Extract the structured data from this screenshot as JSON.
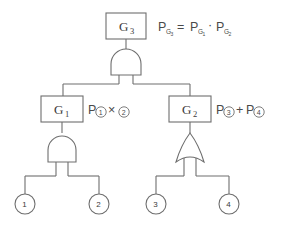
{
  "diagram": {
    "type": "fault-tree",
    "title": "",
    "top_gate": {
      "box_label_main": "G",
      "box_label_sub": "3",
      "gate_type": "AND",
      "gate_icon": "and-gate-icon"
    },
    "top_formula": {
      "p1": "P",
      "p1_sub": "G",
      "p1_sub2": "3",
      "equals": "=",
      "p2": "P",
      "p2_sub": "G",
      "p2_sub2": "1",
      "operator": "·",
      "p3": "P",
      "p3_sub": "G",
      "p3_sub2": "2",
      "plain": "P_G3 = P_G1 · P_G2"
    },
    "left_gate": {
      "box_label_main": "G",
      "box_label_sub": "1",
      "gate_type": "AND",
      "gate_icon": "and-gate-icon",
      "formula": {
        "p": "P",
        "term1": "1",
        "operator": "×",
        "term2": "2",
        "plain": "P①×②"
      }
    },
    "right_gate": {
      "box_label_main": "G",
      "box_label_sub": "2",
      "gate_type": "OR",
      "gate_icon": "or-gate-icon",
      "formula": {
        "p": "P",
        "term1": "3",
        "operator": "+",
        "p2": "P",
        "term2": "4",
        "plain": "P③+P④"
      }
    },
    "basic_events": [
      {
        "label": "1",
        "name": "basic-event-1"
      },
      {
        "label": "2",
        "name": "basic-event-2"
      },
      {
        "label": "3",
        "name": "basic-event-3"
      },
      {
        "label": "4",
        "name": "basic-event-4"
      }
    ],
    "colors": {
      "stroke": "#6e6e6e",
      "text": "#3a3a3a",
      "formula_text": "#4a4a4a",
      "background": "#ffffff"
    }
  }
}
